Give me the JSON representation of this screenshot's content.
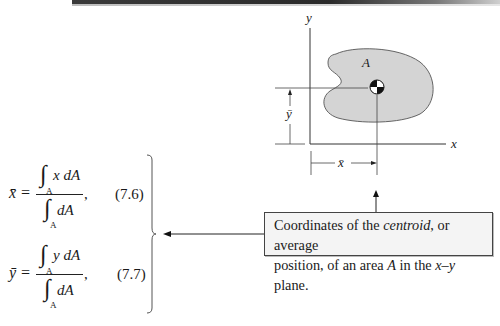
{
  "header_rule": {
    "color": "#2a2a2a"
  },
  "figure": {
    "axis_x_label": "x",
    "axis_y_label": "y",
    "area_label": "A",
    "xbar_dimension_label": "x̄",
    "ybar_dimension_label": "ȳ",
    "area_fill_color": "#d4d4d4",
    "centroid_symbol": "centroid-marker"
  },
  "equations": [
    {
      "lhs": "x̄ =",
      "numerator": "x dA",
      "denominator": "dA",
      "integral_subscript": "A",
      "number": "(7.6)"
    },
    {
      "lhs": "ȳ =",
      "numerator": "y dA",
      "denominator": "dA",
      "integral_subscript": "A",
      "number": "(7.7)"
    }
  ],
  "callout": {
    "line1_pre": "Coordinates of the ",
    "line1_em": "centroid",
    "line1_post": ", or average",
    "line2_pre": "position, of an area ",
    "line2_em": "A",
    "line2_mid": " in the ",
    "line2_em2": "x–y",
    "line2_post": " plane."
  },
  "punctuation": {
    "comma": ","
  }
}
